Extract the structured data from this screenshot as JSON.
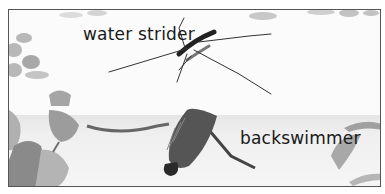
{
  "labels": {
    "water_strider": "water strider",
    "backswimmer": "backswimmer"
  },
  "colors": {
    "background": "#fbfbfb",
    "border": "#555555",
    "underwater": "#efefef",
    "text": "#1a1a1a"
  }
}
